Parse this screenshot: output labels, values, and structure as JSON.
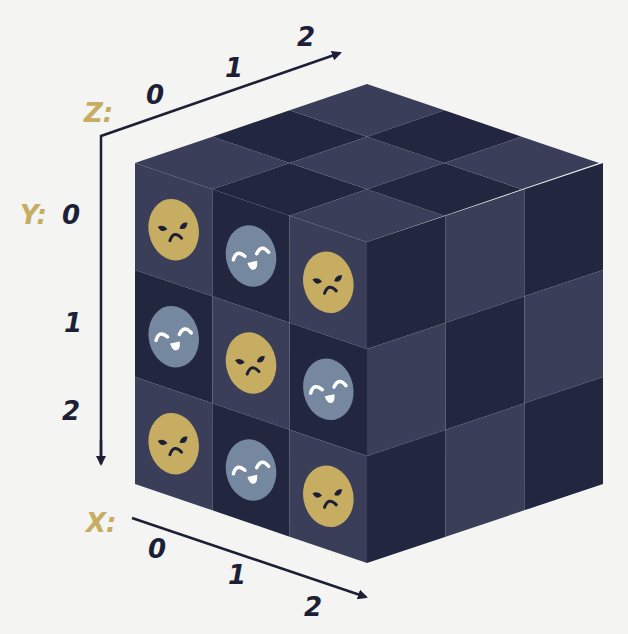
{
  "axes": {
    "z": {
      "name": "Z:",
      "ticks": [
        "0",
        "1",
        "2"
      ]
    },
    "y": {
      "name": "Y:",
      "ticks": [
        "0",
        "1",
        "2"
      ]
    },
    "x": {
      "name": "X:",
      "ticks": [
        "0",
        "1",
        "2"
      ]
    }
  },
  "cube": {
    "size": [
      3,
      3,
      3
    ],
    "front_face_cells": [
      {
        "x": 0,
        "y": 0,
        "face": "frown"
      },
      {
        "x": 1,
        "y": 0,
        "face": "smile"
      },
      {
        "x": 2,
        "y": 0,
        "face": "frown"
      },
      {
        "x": 0,
        "y": 1,
        "face": "smile"
      },
      {
        "x": 1,
        "y": 1,
        "face": "frown"
      },
      {
        "x": 2,
        "y": 1,
        "face": "smile"
      },
      {
        "x": 0,
        "y": 2,
        "face": "frown"
      },
      {
        "x": 1,
        "y": 2,
        "face": "smile"
      },
      {
        "x": 2,
        "y": 2,
        "face": "frown"
      }
    ]
  },
  "colors": {
    "background": "#f4f4f2",
    "cube_light": "#3a3e58",
    "cube_dark": "#23263f",
    "frown_face": "#c6ad62",
    "smile_face": "#76889f",
    "axis_label": "#c6ad62",
    "tick_label": "#1d1f36",
    "axis_line": "#1d1f36"
  }
}
